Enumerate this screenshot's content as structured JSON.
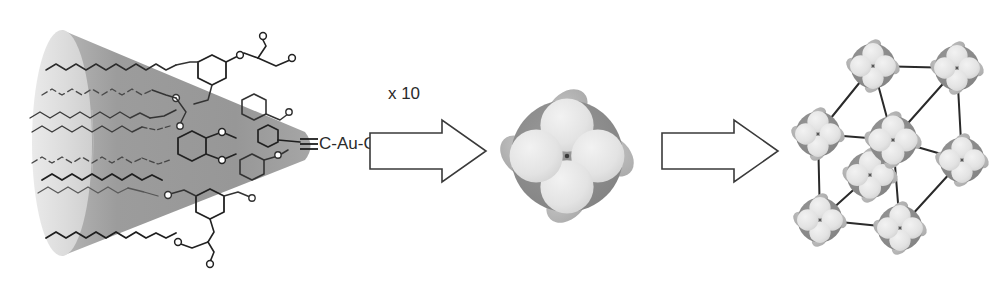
{
  "figure": {
    "kind": "reaction-scheme",
    "background_color": "#ffffff",
    "width": 1007,
    "height": 287
  },
  "colors": {
    "cone_body": "#9a9a9a",
    "cone_base_light": "#e2e2e2",
    "cone_base_edge": "#c9c9c9",
    "molecule_dark": "#1e1e1e",
    "molecule_mid": "#555555",
    "sphere_core": "#8e8e8e",
    "sphere_lobe": "#e8e8e8",
    "sphere_lobe_back": "#b4b4b4",
    "lattice_edge": "#2a2a2a",
    "arrow_outline": "#3a3a3a",
    "arrow_fill": "#ffffff",
    "text": "#2b2b2b"
  },
  "steps": [
    {
      "id": "cone",
      "name": "dendritic-cone",
      "label": "",
      "endgroup_label": "C-Au-Cl",
      "endgroup_bond": "triple"
    },
    {
      "id": "arrow-1",
      "name": "assembly-arrow-1",
      "label": "x 10",
      "direction": "right"
    },
    {
      "id": "sphere",
      "name": "supramolecular-sphere",
      "label": "",
      "front_lobes": 4,
      "back_lobes": 4
    },
    {
      "id": "arrow-2",
      "name": "assembly-arrow-2",
      "label": "",
      "direction": "right"
    },
    {
      "id": "lattice",
      "name": "bcc-lattice",
      "label": "",
      "node_count": 9,
      "lattice_type": "body-centred cubic"
    }
  ],
  "cone": {
    "apex_label": "C-Au-Cl",
    "triple_bond_glyph": "≡",
    "alkyl_chain_count": 6,
    "base_ellipse": {
      "cx": 62,
      "cy": 143,
      "rx": 30,
      "ry": 113
    },
    "apex": {
      "x": 305,
      "y": 146
    }
  },
  "arrows": {
    "first": {
      "label": "x 10",
      "x": 368,
      "y": 120,
      "w": 118,
      "h": 62
    },
    "second": {
      "label": "",
      "x": 660,
      "y": 120,
      "w": 118,
      "h": 62
    }
  },
  "sphere": {
    "cx": 567,
    "cy": 156,
    "r": 56
  },
  "lattice": {
    "nodes": [
      {
        "name": "node-back-top-left",
        "x": 873,
        "y": 66,
        "r": 25,
        "depth": "back"
      },
      {
        "name": "node-back-top-right",
        "x": 957,
        "y": 68,
        "r": 25,
        "depth": "back"
      },
      {
        "name": "node-front-top-left",
        "x": 818,
        "y": 134,
        "r": 25,
        "depth": "front"
      },
      {
        "name": "node-center",
        "x": 893,
        "y": 140,
        "r": 27,
        "depth": "mid"
      },
      {
        "name": "node-back-bot-right",
        "x": 962,
        "y": 160,
        "r": 25,
        "depth": "back"
      },
      {
        "name": "node-mid-overlap",
        "x": 870,
        "y": 175,
        "r": 25,
        "depth": "front"
      },
      {
        "name": "node-front-bot-left",
        "x": 820,
        "y": 220,
        "r": 25,
        "depth": "front"
      },
      {
        "name": "node-front-bot-right",
        "x": 900,
        "y": 228,
        "r": 25,
        "depth": "front"
      }
    ],
    "edges": [
      [
        "node-back-top-left",
        "node-back-top-right"
      ],
      [
        "node-back-top-left",
        "node-front-top-left"
      ],
      [
        "node-back-top-left",
        "node-center"
      ],
      [
        "node-back-top-right",
        "node-back-bot-right"
      ],
      [
        "node-back-top-right",
        "node-center"
      ],
      [
        "node-front-top-left",
        "node-center"
      ],
      [
        "node-front-top-left",
        "node-front-bot-left"
      ],
      [
        "node-center",
        "node-mid-overlap"
      ],
      [
        "node-back-bot-right",
        "node-front-bot-right"
      ],
      [
        "node-front-bot-left",
        "node-mid-overlap"
      ],
      [
        "node-front-bot-left",
        "node-front-bot-right"
      ],
      [
        "node-front-bot-right",
        "node-back-bot-right"
      ]
    ]
  }
}
